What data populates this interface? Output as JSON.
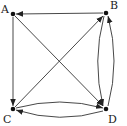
{
  "diagram": {
    "type": "directed-graph",
    "nodes": [
      {
        "id": "A",
        "label": "A",
        "x": 13,
        "y": 14,
        "label_x": 1,
        "label_y": 13
      },
      {
        "id": "B",
        "label": "B",
        "x": 106,
        "y": 13,
        "label_x": 110,
        "label_y": 9
      },
      {
        "id": "C",
        "label": "C",
        "x": 13,
        "y": 109,
        "label_x": 3,
        "label_y": 122
      },
      {
        "id": "D",
        "label": "D",
        "x": 106,
        "y": 109,
        "label_x": 110,
        "label_y": 122
      }
    ],
    "edges": [
      {
        "from": "B",
        "to": "A",
        "shape": "straight"
      },
      {
        "from": "A",
        "to": "C",
        "shape": "straight"
      },
      {
        "from": "A",
        "to": "D",
        "shape": "straight"
      },
      {
        "from": "C",
        "to": "B",
        "shape": "straight"
      },
      {
        "from": "C",
        "to": "D",
        "shape": "arc-upper"
      },
      {
        "from": "D",
        "to": "C",
        "shape": "arc-lower"
      },
      {
        "from": "B",
        "to": "D",
        "shape": "arc-left"
      },
      {
        "from": "D",
        "to": "B",
        "shape": "arc-right"
      }
    ],
    "colors": {
      "stroke": "#333333",
      "node": "#111111",
      "background": "#ffffff"
    }
  }
}
